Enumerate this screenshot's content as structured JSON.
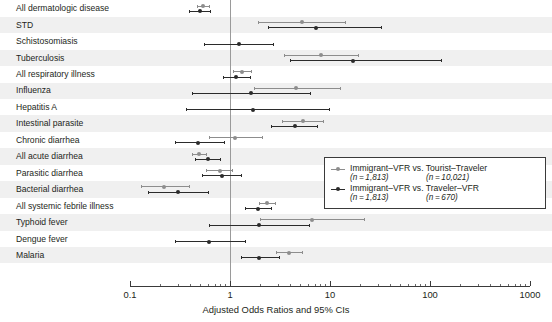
{
  "chart_data": {
    "type": "scatter",
    "title": "",
    "subtitle": "",
    "xlabel": "Adjusted Odds Ratios and 95% CIs",
    "ylabel": "",
    "xscale": "log",
    "xlim": [
      0.1,
      1000
    ],
    "xticks": [
      0.1,
      1,
      10,
      100,
      1000
    ],
    "xticklabels": [
      "0.1",
      "1",
      "10",
      "100",
      "1000"
    ],
    "grid": false,
    "reference_line": 1,
    "legend_position": "center-right",
    "categories": [
      "All dermatologic disease",
      "STD",
      "Schistosomiasis",
      "Tuberculosis",
      "All respiratory illness",
      "Influenza",
      "Hepatitis A",
      "Intestinal parasite",
      "Chronic diarrhea",
      "All acute diarrhea",
      "Parasitic diarrhea",
      "Bacterial diarrhea",
      "All systemic febrile illness",
      "Typhoid fever",
      "Dengue fever",
      "Malaria"
    ],
    "series": [
      {
        "name": "Immigrant-VFR vs. Tourist-Traveler",
        "color": "#8d8d8d",
        "points": [
          {
            "category": "All dermatologic disease",
            "or": 0.54,
            "low": 0.47,
            "high": 0.62
          },
          {
            "category": "STD",
            "or": 5.2,
            "low": 1.9,
            "high": 14.0
          },
          {
            "category": "Schistosomiasis",
            "or": null,
            "low": null,
            "high": null
          },
          {
            "category": "Tuberculosis",
            "or": 8.2,
            "low": 3.5,
            "high": 19.0
          },
          {
            "category": "All respiratory illness",
            "or": 1.32,
            "low": 1.08,
            "high": 1.62
          },
          {
            "category": "Influenza",
            "or": 4.6,
            "low": 1.75,
            "high": 12.5
          },
          {
            "category": "Hepatitis A",
            "or": null,
            "low": null,
            "high": null
          },
          {
            "category": "Intestinal parasite",
            "or": 5.4,
            "low": 3.3,
            "high": 8.6
          },
          {
            "category": "Chronic diarrhea",
            "or": 1.13,
            "low": 0.62,
            "high": 2.1
          },
          {
            "category": "All acute diarrhea",
            "or": 0.49,
            "low": 0.42,
            "high": 0.57
          },
          {
            "category": "Parasitic diarrhea",
            "or": 0.79,
            "low": 0.58,
            "high": 1.05
          },
          {
            "category": "Bacterial diarrhea",
            "or": 0.22,
            "low": 0.13,
            "high": 0.39
          },
          {
            "category": "All systemic febrile illness",
            "or": 2.35,
            "low": 1.95,
            "high": 2.85
          },
          {
            "category": "Typhoid fever",
            "or": 6.6,
            "low": 2.0,
            "high": 22.0
          },
          {
            "category": "Dengue fever",
            "or": null,
            "low": null,
            "high": null
          },
          {
            "category": "Malaria",
            "or": 3.9,
            "low": 2.9,
            "high": 5.2
          }
        ]
      },
      {
        "name": "Immigrant-VFR vs. Traveler-VFR",
        "color": "#2b2b2b",
        "points": [
          {
            "category": "All dermatologic disease",
            "or": 0.5,
            "low": 0.39,
            "high": 0.63
          },
          {
            "category": "STD",
            "or": 7.3,
            "low": 2.4,
            "high": 32.0
          },
          {
            "category": "Schistosomiasis",
            "or": 1.22,
            "low": 0.55,
            "high": 2.7
          },
          {
            "category": "Tuberculosis",
            "or": 17.0,
            "low": 4.0,
            "high": 130.0
          },
          {
            "category": "All respiratory illness",
            "or": 1.16,
            "low": 0.85,
            "high": 1.6
          },
          {
            "category": "Influenza",
            "or": 1.62,
            "low": 0.42,
            "high": 6.3
          },
          {
            "category": "Hepatitis A",
            "or": 1.7,
            "low": 0.36,
            "high": 9.8
          },
          {
            "category": "Intestinal parasite",
            "or": 4.5,
            "low": 2.6,
            "high": 7.4
          },
          {
            "category": "Chronic diarrhea",
            "or": 0.48,
            "low": 0.28,
            "high": 0.87
          },
          {
            "category": "All acute diarrhea",
            "or": 0.6,
            "low": 0.45,
            "high": 0.8
          },
          {
            "category": "Parasitic diarrhea",
            "or": 0.83,
            "low": 0.53,
            "high": 1.28
          },
          {
            "category": "Bacterial diarrhea",
            "or": 0.3,
            "low": 0.15,
            "high": 0.6
          },
          {
            "category": "All systemic febrile illness",
            "or": 1.9,
            "low": 1.42,
            "high": 2.55
          },
          {
            "category": "Typhoid fever",
            "or": 1.95,
            "low": 0.62,
            "high": 6.2
          },
          {
            "category": "Dengue fever",
            "or": 0.62,
            "low": 0.28,
            "high": 1.4
          },
          {
            "category": "Malaria",
            "or": 1.95,
            "low": 1.3,
            "high": 3.1
          }
        ]
      }
    ],
    "annotations": []
  },
  "legend": {
    "entries": [
      {
        "label": "Immigrant–VFR vs. Tourist–Traveler",
        "n_left": "(n = 1,813)",
        "n_right": "(n = 10,021)"
      },
      {
        "label": "Immigrant–VFR vs. Traveler–VFR",
        "n_left": "(n = 1,813)",
        "n_right": "(n = 670)"
      }
    ]
  },
  "colors": {
    "series1": "#8d8d8d",
    "series2": "#2b2b2b",
    "band": "#f0f0f0",
    "text": "#231f20",
    "axis": "#3a3a3a",
    "refline": "#9a9a9a"
  }
}
